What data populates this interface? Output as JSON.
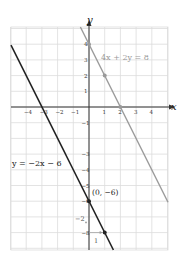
{
  "chart_data": {
    "type": "line",
    "title": "",
    "xlabel": "x",
    "ylabel": "y",
    "xlim": [
      -5,
      5
    ],
    "ylim": [
      -9.5,
      5
    ],
    "grid": true,
    "x_ticks": [
      -4,
      -3,
      -2,
      -1,
      1,
      2,
      3,
      4
    ],
    "y_ticks": [
      4,
      3,
      2,
      1,
      -1,
      -3,
      -4,
      -5,
      -6,
      -8
    ],
    "series": [
      {
        "name": "4x + 2y = 8",
        "label": "4x + 2y = 8",
        "slope": -2,
        "intercept": 4,
        "color": "#9a9a9a",
        "points": [
          [
            0,
            4
          ],
          [
            1,
            2
          ],
          [
            2,
            0
          ]
        ]
      },
      {
        "name": "y = −2x − 6",
        "label": "y = −2x − 6",
        "slope": -2,
        "intercept": -6,
        "color": "#222222",
        "points": [
          [
            0,
            -6
          ],
          [
            1,
            -8
          ]
        ]
      }
    ],
    "annotations": [
      {
        "text": "(0, −6)",
        "x": 0,
        "y": -6
      },
      {
        "text": "−2",
        "note": "rise"
      },
      {
        "text": "1",
        "note": "run"
      }
    ]
  }
}
